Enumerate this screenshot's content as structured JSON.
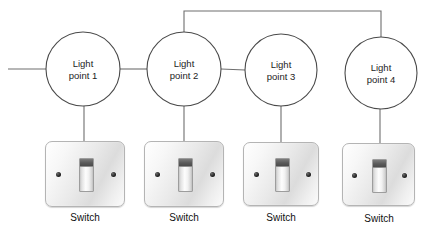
{
  "diagram": {
    "type": "electrical-wiring-diagram",
    "canvas": {
      "width": 424,
      "height": 232
    },
    "colors": {
      "background": "#ffffff",
      "wire": "#6e6e6e",
      "node_outline": "#4a4a4a",
      "text": "#1d1d1d",
      "plate_border": "#b4b4b4",
      "screw": "#1a1a1a",
      "rocker_top": "#5a5a5a"
    },
    "light_points": [
      {
        "id": "light-point-1",
        "label_line1": "Light",
        "label_line2": "point 1",
        "cx": 83,
        "cy": 69,
        "r": 37
      },
      {
        "id": "light-point-2",
        "label_line1": "Light",
        "label_line2": "point 2",
        "cx": 184,
        "cy": 69,
        "r": 37
      },
      {
        "id": "light-point-3",
        "label_line1": "Light",
        "label_line2": "point 3",
        "cx": 281,
        "cy": 70,
        "r": 36
      },
      {
        "id": "light-point-4",
        "label_line1": "Light",
        "label_line2": "point 4",
        "cx": 381,
        "cy": 73,
        "r": 36
      }
    ],
    "switches": [
      {
        "id": "switch-1",
        "caption": "Switch",
        "x": 45,
        "y": 141,
        "w": 80,
        "h": 66,
        "caption_x": 85,
        "caption_y": 221
      },
      {
        "id": "switch-2",
        "caption": "Switch",
        "x": 144,
        "y": 141,
        "w": 80,
        "h": 66,
        "caption_x": 184,
        "caption_y": 221
      },
      {
        "id": "switch-3",
        "caption": "Switch",
        "x": 243,
        "y": 142,
        "w": 76,
        "h": 64,
        "caption_x": 281,
        "caption_y": 221
      },
      {
        "id": "switch-4",
        "caption": "Switch",
        "x": 342,
        "y": 143,
        "w": 73,
        "h": 63,
        "caption_x": 379,
        "caption_y": 222
      }
    ],
    "wires": [
      {
        "id": "supply-lead-in",
        "path": "M 8 69 L 46 69"
      },
      {
        "id": "link-lamp1-lamp2",
        "path": "M 120 69 L 147 69"
      },
      {
        "id": "link-lamp2-lamp3",
        "path": "M 221 69 L 245 70"
      },
      {
        "id": "top-bus-lamp2-to-lamp4",
        "path": "M 184 32 L 184 11 L 381 11 L 381 37"
      },
      {
        "id": "drop-lamp1-switch1",
        "path": "M 84 106 L 84 141"
      },
      {
        "id": "drop-lamp2-switch2",
        "path": "M 184 106 L 184 141"
      },
      {
        "id": "drop-lamp3-switch3",
        "path": "M 281 106 L 281 142"
      },
      {
        "id": "drop-lamp4-switch4",
        "path": "M 380 109 L 380 143"
      }
    ]
  }
}
